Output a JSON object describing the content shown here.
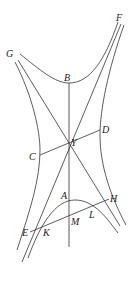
{
  "figure": {
    "type": "geometric-diagram",
    "labels": {
      "G": "G",
      "F": "F",
      "B": "B",
      "D": "D",
      "C": "C",
      "Y": "Y",
      "A": "A",
      "H": "H",
      "L": "L",
      "M": "M",
      "E": "E",
      "K": "K"
    }
  }
}
